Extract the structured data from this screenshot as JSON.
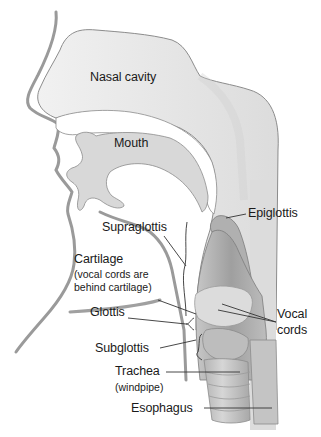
{
  "diagram": {
    "title": "",
    "colors": {
      "outline": "#8c8c8c",
      "cavity_fill": "#e4e4e4",
      "tissue_dark": "#a9a9a9",
      "tissue_mid": "#c8c8c8",
      "cartilage": "#dedede",
      "leader": "#333333",
      "text": "#1a1a1a"
    },
    "labels": {
      "nasal_cavity": "Nasal cavity",
      "mouth": "Mouth",
      "epiglottis": "Epiglottis",
      "supraglottis": "Supraglottis",
      "cartilage": "Cartilage",
      "cartilage_note_line1": "(vocal cords are",
      "cartilage_note_line2": "behind cartilage)",
      "glottis": "Glottis",
      "vocal_cords_line1": "Vocal",
      "vocal_cords_line2": "cords",
      "subglottis": "Subglottis",
      "trachea": "Trachea",
      "trachea_note": "(windpipe)",
      "esophagus": "Esophagus"
    }
  }
}
